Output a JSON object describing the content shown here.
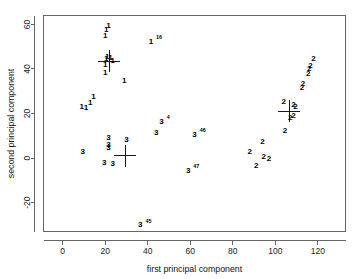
{
  "chart_data": {
    "type": "scatter",
    "title": "",
    "xlabel": "first principal component",
    "ylabel": "second principal component",
    "xlim": [
      -9,
      133
    ],
    "ylim": [
      -33,
      64
    ],
    "xticks": [
      0,
      20,
      40,
      60,
      80,
      100,
      120
    ],
    "yticks": [
      -20,
      0,
      20,
      40,
      60
    ],
    "grid": false,
    "legend": "none",
    "point_label_is_class": true,
    "classes": [
      "1",
      "2",
      "3"
    ],
    "series": [
      {
        "name": "class 1",
        "label": "1",
        "points": [
          {
            "x": 20.5,
            "y": 57.5,
            "sup": ""
          },
          {
            "x": 21.5,
            "y": 59.5,
            "sup": ""
          },
          {
            "x": 20.0,
            "y": 55.0,
            "sup": ""
          },
          {
            "x": 41.5,
            "y": 52.5,
            "sup": "16"
          },
          {
            "x": 20.5,
            "y": 44.5,
            "sup": ""
          },
          {
            "x": 21.0,
            "y": 45.5,
            "sup": ""
          },
          {
            "x": 22.5,
            "y": 45.0,
            "sup": ""
          },
          {
            "x": 23.5,
            "y": 44.0,
            "sup": ""
          },
          {
            "x": 20.0,
            "y": 42.0,
            "sup": ""
          },
          {
            "x": 20.0,
            "y": 38.5,
            "sup": ""
          },
          {
            "x": 29.0,
            "y": 35.0,
            "sup": ""
          },
          {
            "x": 14.5,
            "y": 27.5,
            "sup": ""
          },
          {
            "x": 13.0,
            "y": 25.0,
            "sup": ""
          },
          {
            "x": 9.0,
            "y": 23.0,
            "sup": ""
          },
          {
            "x": 11.0,
            "y": 22.5,
            "sup": ""
          }
        ]
      },
      {
        "name": "class 2",
        "label": "2",
        "points": [
          {
            "x": 118.0,
            "y": 44.5,
            "sup": ""
          },
          {
            "x": 116.5,
            "y": 41.5,
            "sup": ""
          },
          {
            "x": 116.0,
            "y": 40.0,
            "sup": ""
          },
          {
            "x": 115.5,
            "y": 38.0,
            "sup": ""
          },
          {
            "x": 113.0,
            "y": 33.5,
            "sup": ""
          },
          {
            "x": 112.5,
            "y": 31.5,
            "sup": ""
          },
          {
            "x": 104.0,
            "y": 25.5,
            "sup": ""
          },
          {
            "x": 108.5,
            "y": 24.0,
            "sup": ""
          },
          {
            "x": 109.5,
            "y": 23.0,
            "sup": ""
          },
          {
            "x": 108.5,
            "y": 19.0,
            "sup": ""
          },
          {
            "x": 107.0,
            "y": 18.0,
            "sup": ""
          },
          {
            "x": 104.5,
            "y": 12.5,
            "sup": ""
          },
          {
            "x": 94.0,
            "y": 7.5,
            "sup": ""
          },
          {
            "x": 88.0,
            "y": 3.0,
            "sup": ""
          },
          {
            "x": 94.5,
            "y": 0.5,
            "sup": ""
          },
          {
            "x": 97.0,
            "y": 0.0,
            "sup": ""
          },
          {
            "x": 91.0,
            "y": -3.5,
            "sup": ""
          }
        ]
      },
      {
        "name": "class 3",
        "label": "3",
        "points": [
          {
            "x": 46.5,
            "y": 16.5,
            "sup": "4"
          },
          {
            "x": 44.0,
            "y": 11.5,
            "sup": ""
          },
          {
            "x": 62.0,
            "y": 10.5,
            "sup": "46"
          },
          {
            "x": 21.5,
            "y": 9.0,
            "sup": ""
          },
          {
            "x": 21.5,
            "y": 6.0,
            "sup": ""
          },
          {
            "x": 21.5,
            "y": 4.5,
            "sup": ""
          },
          {
            "x": 30.0,
            "y": 8.5,
            "sup": ""
          },
          {
            "x": 9.5,
            "y": 3.0,
            "sup": ""
          },
          {
            "x": 19.5,
            "y": -2.0,
            "sup": ""
          },
          {
            "x": 23.5,
            "y": -2.5,
            "sup": ""
          },
          {
            "x": 59.0,
            "y": -5.5,
            "sup": "47"
          },
          {
            "x": 36.5,
            "y": -30.0,
            "sup": "45"
          }
        ]
      }
    ],
    "centroids": [
      {
        "name": "centroid-class-1",
        "x": 22.0,
        "y": 43.5
      },
      {
        "name": "centroid-class-2",
        "x": 106.5,
        "y": 21.0
      },
      {
        "name": "centroid-class-3",
        "x": 29.5,
        "y": 1.0
      }
    ]
  }
}
